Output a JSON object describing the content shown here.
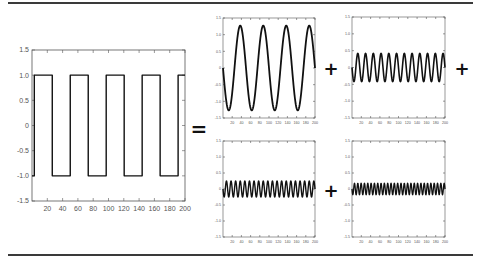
{
  "figure": {
    "operators": [
      "=",
      "+",
      "+",
      "+"
    ]
  },
  "chart_data": [
    {
      "type": "line",
      "name": "square-wave",
      "title": "",
      "xlabel": "",
      "ylabel": "",
      "xlim": [
        0,
        200
      ],
      "ylim": [
        -1.5,
        1.5
      ],
      "xticks": [
        20,
        40,
        60,
        80,
        100,
        120,
        140,
        160,
        180,
        200
      ],
      "yticks": [
        1.5,
        1.0,
        0.5,
        0,
        -0.5,
        -1.0,
        -1.5
      ],
      "ytick_labels": [
        "1.5",
        "1.0",
        "0.5",
        "0",
        "-0.5",
        "-1.0",
        "-1.5"
      ],
      "grid": false,
      "waveform": "square",
      "amplitude": 1.0,
      "period": 47,
      "phase_start": 3,
      "cycles": 4
    },
    {
      "type": "line",
      "name": "harmonic-1",
      "xlim": [
        0,
        200
      ],
      "ylim": [
        -1.5,
        1.5
      ],
      "xticks": [
        20,
        40,
        60,
        80,
        100,
        120,
        140,
        160,
        180,
        200
      ],
      "yticks": [
        1.5,
        1.0,
        0.5,
        0,
        -0.5,
        -1.0,
        -1.5
      ],
      "waveform": "sine",
      "amplitude": 1.27,
      "cycles": 4,
      "grid": false
    },
    {
      "type": "line",
      "name": "harmonic-3",
      "xlim": [
        0,
        200
      ],
      "ylim": [
        -1.5,
        1.5
      ],
      "xticks": [
        20,
        40,
        60,
        80,
        100,
        120,
        140,
        160,
        180,
        200
      ],
      "yticks": [
        1.5,
        1.0,
        0.5,
        0,
        -0.5,
        -1.0,
        -1.5
      ],
      "waveform": "sine",
      "amplitude": 0.42,
      "cycles": 12,
      "grid": false
    },
    {
      "type": "line",
      "name": "harmonic-5",
      "xlim": [
        0,
        200
      ],
      "ylim": [
        -1.5,
        1.5
      ],
      "xticks": [
        20,
        40,
        60,
        80,
        100,
        120,
        140,
        160,
        180,
        200
      ],
      "yticks": [
        1.5,
        1.0,
        0.5,
        0,
        -0.5,
        -1.0,
        -1.5
      ],
      "waveform": "sine",
      "amplitude": 0.25,
      "cycles": 20,
      "grid": false
    },
    {
      "type": "line",
      "name": "harmonic-7",
      "xlim": [
        0,
        200
      ],
      "ylim": [
        -1.5,
        1.5
      ],
      "xticks": [
        20,
        40,
        60,
        80,
        100,
        120,
        140,
        160,
        180,
        200
      ],
      "yticks": [
        1.5,
        1.0,
        0.5,
        0,
        -0.5,
        -1.0,
        -1.5
      ],
      "waveform": "sine",
      "amplitude": 0.18,
      "cycles": 28,
      "grid": false
    }
  ]
}
